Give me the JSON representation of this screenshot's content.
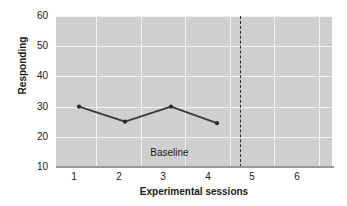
{
  "chart_data": {
    "type": "line",
    "title": "",
    "xlabel": "Experimental sessions",
    "ylabel": "Responding",
    "x": [
      1,
      2,
      3,
      4
    ],
    "values": [
      30,
      25,
      30,
      24.5
    ],
    "series": [
      {
        "name": "Baseline responding",
        "x": [
          1,
          2,
          3,
          4
        ],
        "values": [
          30,
          25,
          30,
          24.5
        ]
      }
    ],
    "xlim": [
      0.5,
      6.5
    ],
    "ylim": [
      10,
      60
    ],
    "xticks": [
      1,
      2,
      3,
      4,
      5,
      6
    ],
    "yticks": [
      10,
      20,
      30,
      40,
      50,
      60
    ],
    "xtick_labels": [
      "1",
      "2",
      "3",
      "4",
      "5",
      "6"
    ],
    "ytick_labels": [
      "10",
      "20",
      "30",
      "40",
      "50",
      "60"
    ],
    "grid": true,
    "legend": "none",
    "annotations": [
      {
        "text": "Baseline",
        "x": 2.55,
        "y": 12.5
      },
      {
        "type": "phase-change-line",
        "style": "dashed",
        "x": 4.5
      }
    ],
    "colors": {
      "plot_background": "#cfcfcf",
      "gridline": "#f2f2f2",
      "series_line": "#3a3a3a",
      "marker": "#2b2b2b",
      "axis": "#9a9a9a",
      "text": "#1a1a1a",
      "phase_line": "#2b2b2b"
    }
  },
  "axes": {
    "y_title": "Responding",
    "x_title": "Experimental sessions",
    "y_labels": [
      "60",
      "50",
      "40",
      "30",
      "20",
      "10"
    ],
    "x_labels": [
      "1",
      "2",
      "3",
      "4",
      "5",
      "6"
    ]
  },
  "annotations": {
    "baseline_label": "Baseline"
  }
}
